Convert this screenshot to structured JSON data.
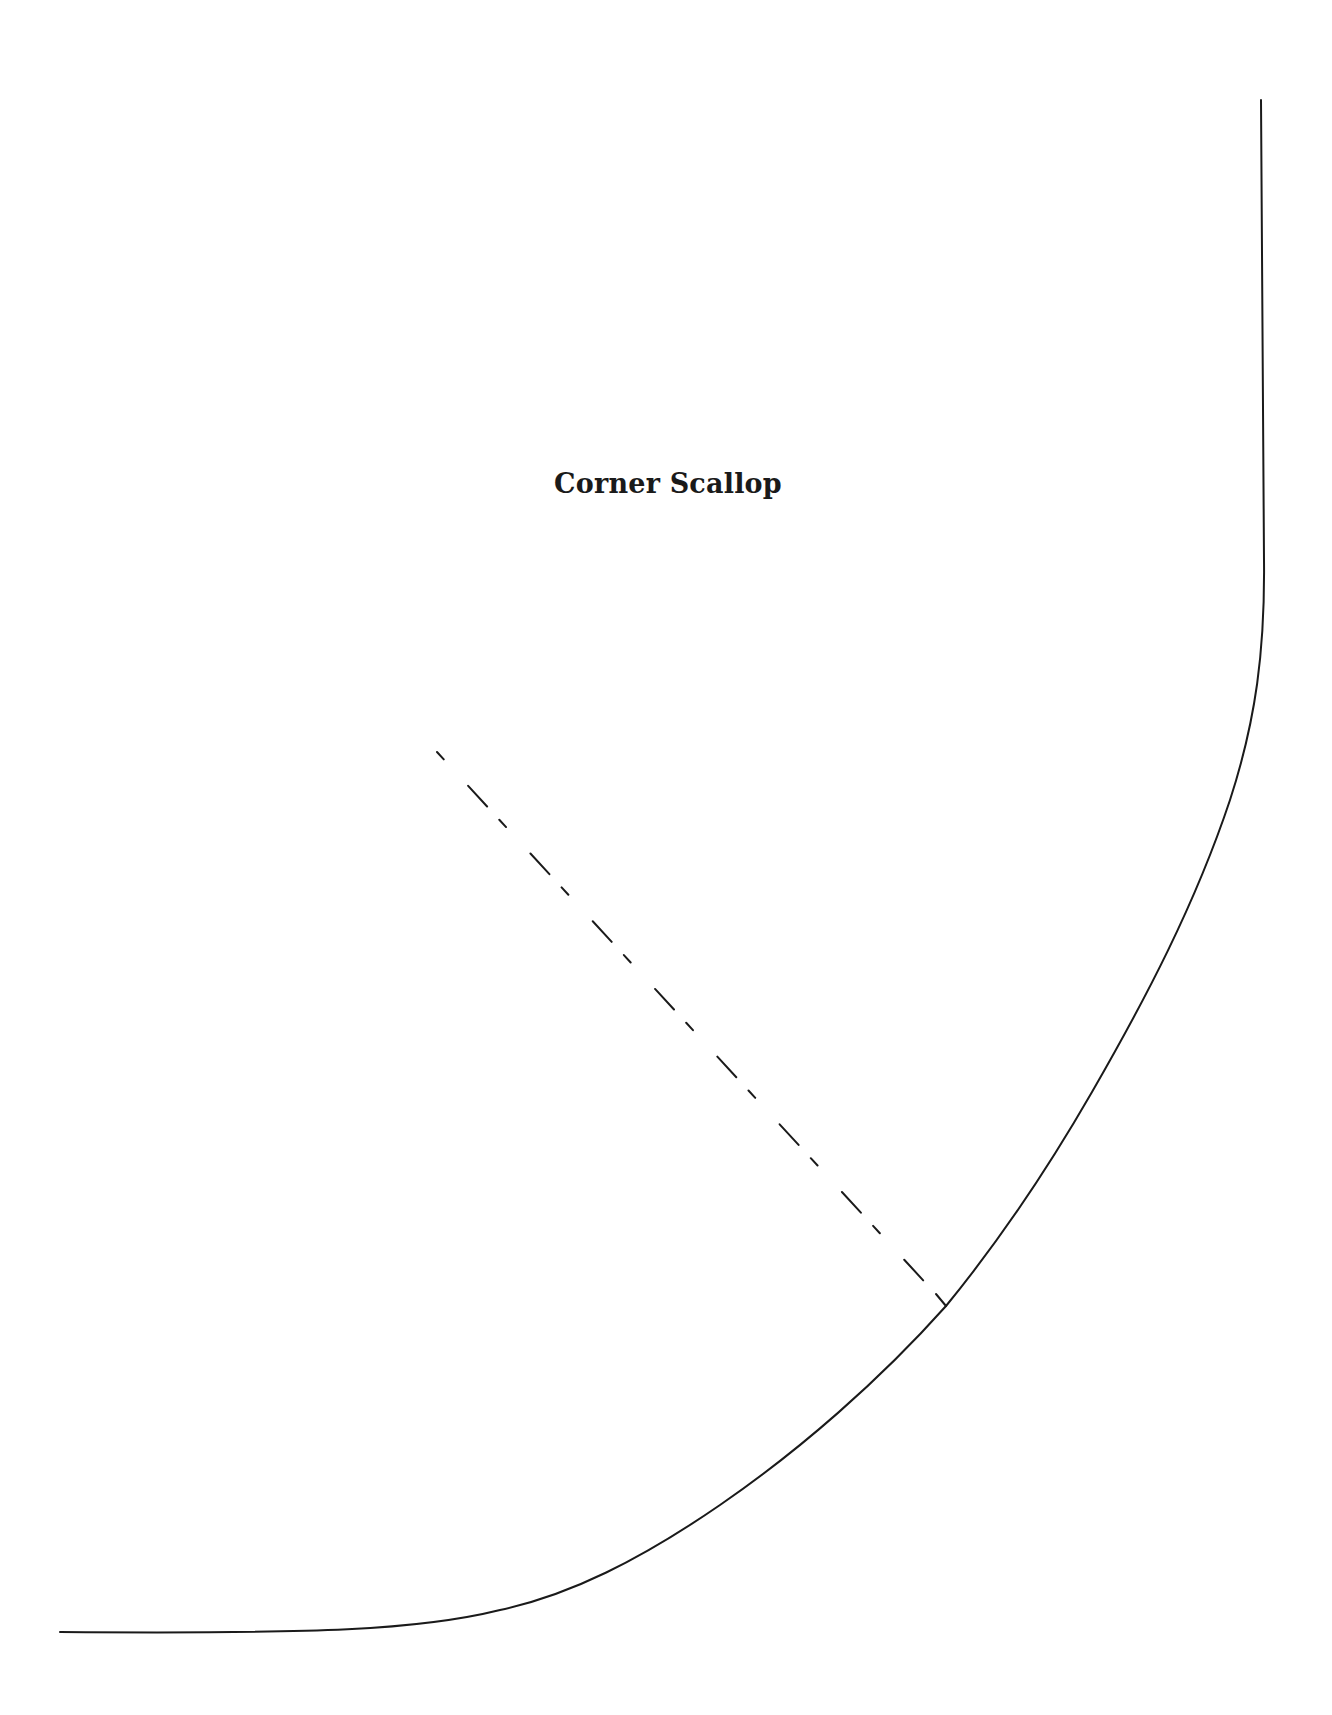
{
  "pattern": {
    "title": "Corner Scallop",
    "line_color": "#1a1a1a",
    "background": "#ffffff",
    "elements": {
      "cut_line": "solid curved outline (corner scallop edge)",
      "fold_line": "dashed diagonal line with end tick"
    }
  }
}
